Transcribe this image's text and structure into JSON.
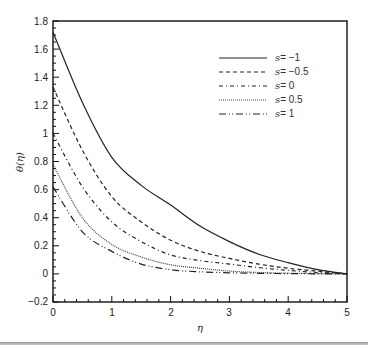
{
  "chart_data": {
    "type": "line",
    "title": "",
    "xlabel": "η",
    "ylabel": "θ(η)",
    "xlim": [
      0,
      5
    ],
    "ylim": [
      -0.2,
      1.8
    ],
    "xticks": [
      0,
      1,
      2,
      3,
      4,
      5
    ],
    "yticks": [
      -0.2,
      0,
      0.2,
      0.4,
      0.6,
      0.8,
      1,
      1.2,
      1.4,
      1.6,
      1.8
    ],
    "ytick_labels": [
      "-0.2",
      "0",
      "0.2",
      "0.4",
      "0.6",
      "0.8",
      "1",
      "1.2",
      "1.4",
      "1.6",
      "1.8"
    ],
    "grid": false,
    "legend_position": "upper right",
    "x": [
      0,
      0.5,
      1,
      1.5,
      2,
      2.5,
      3,
      3.5,
      4,
      4.5,
      5
    ],
    "series": [
      {
        "name": "s = -1",
        "style": "solid",
        "values": [
          1.72,
          1.22,
          0.83,
          0.63,
          0.49,
          0.34,
          0.23,
          0.14,
          0.08,
          0.03,
          0.0
        ]
      },
      {
        "name": "s = -0.5",
        "style": "dashed",
        "values": [
          1.33,
          0.88,
          0.55,
          0.37,
          0.24,
          0.16,
          0.11,
          0.07,
          0.04,
          0.02,
          0.0
        ]
      },
      {
        "name": "s = 0",
        "style": "dash-dot",
        "values": [
          1.0,
          0.62,
          0.37,
          0.23,
          0.135,
          0.095,
          0.07,
          0.045,
          0.025,
          0.01,
          0.0
        ]
      },
      {
        "name": "s = 0.5",
        "style": "dotted",
        "values": [
          0.78,
          0.4,
          0.21,
          0.12,
          0.065,
          0.04,
          0.02,
          0.01,
          0.005,
          0.002,
          0.0
        ]
      },
      {
        "name": "s = 1",
        "style": "dash-dot-dot",
        "values": [
          0.62,
          0.3,
          0.16,
          0.07,
          0.03,
          0.015,
          0.008,
          0.004,
          0.002,
          0.001,
          0.0
        ]
      }
    ]
  },
  "legend": {
    "items": [
      {
        "prefix": "s",
        "value": "= −1"
      },
      {
        "prefix": "s",
        "value": "= −0.5"
      },
      {
        "prefix": "s",
        "value": "= 0"
      },
      {
        "prefix": "s",
        "value": "= 0.5"
      },
      {
        "prefix": "s",
        "value": "= 1"
      }
    ]
  },
  "axes": {
    "x_title": "η",
    "y_title": "θ(η)",
    "x_tick_labels": [
      "0",
      "1",
      "2",
      "3",
      "4",
      "5"
    ],
    "y_tick_labels": [
      "−0.2",
      "0",
      "0.2",
      "0.4",
      "0.6",
      "0.8",
      "1",
      "1.2",
      "1.4",
      "1.6",
      "1.8"
    ]
  },
  "colors": {
    "line": "#222222",
    "frame": "#111111",
    "rule": "#a0a0a0"
  }
}
